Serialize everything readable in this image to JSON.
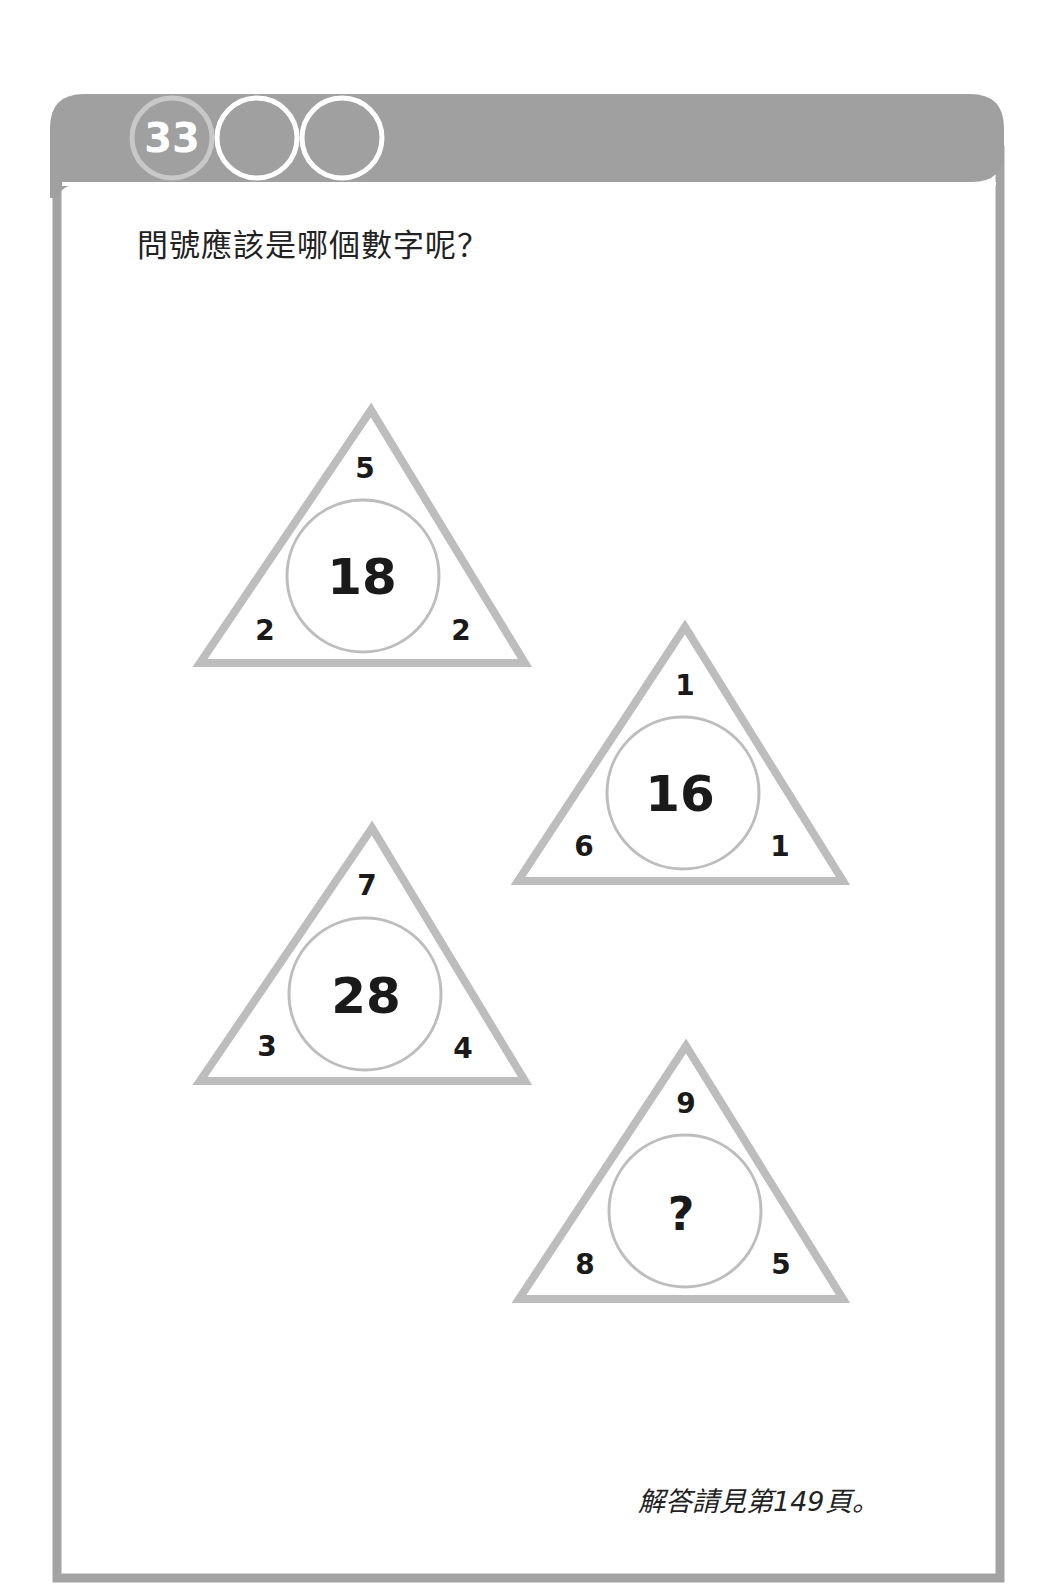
{
  "header": {
    "puzzle_number": "33",
    "badge_count": 3,
    "bar_color": "#a0a0a0"
  },
  "question": "問號應該是哪個數字呢？",
  "puzzles": [
    {
      "top": "5",
      "left": "2",
      "right": "2",
      "center": "18"
    },
    {
      "top": "1",
      "left": "6",
      "right": "1",
      "center": "16"
    },
    {
      "top": "7",
      "left": "3",
      "right": "4",
      "center": "28"
    },
    {
      "top": "9",
      "left": "8",
      "right": "5",
      "center": "?"
    }
  ],
  "footer": {
    "answer_note": "解答請見第149頁。"
  },
  "colors": {
    "frame": "#a3a3a3",
    "triangle_stroke": "#bdbdbd",
    "circle_stroke": "#bdbdbd",
    "text": "#1a1a1a"
  }
}
